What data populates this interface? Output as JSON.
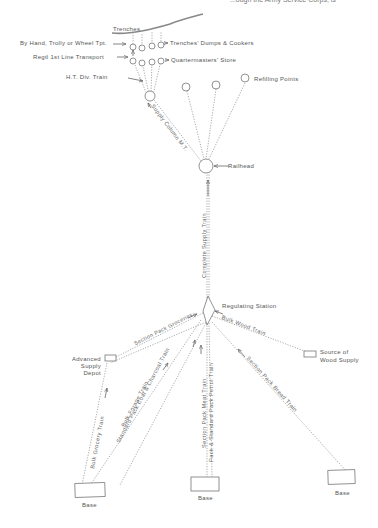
{
  "header_fragment": "...ough the Army Service Corps, is",
  "front": {
    "trenches": "Trenches",
    "by_hand": "By Hand, Trolly or Wheel Tpt.",
    "regtl_transport": "Regtl 1st Line Transport",
    "ht_div_train": "H.T. Div. Train",
    "trenches_dumps": "Trenches' Dumps & Cookers",
    "quartermasters_store": "Quartermasters' Store",
    "refilling_points": "Refilling Points"
  },
  "middle": {
    "supply_column": "Supply Column M.T.",
    "railhead": "Railhead",
    "complete_supply_train": "Complete Supply Train",
    "regulating_station": "Regulating Station"
  },
  "rear": {
    "advanced_supply_depot": "Advanced Supply Depot",
    "source_of_wood_supply_1": "Source of",
    "source_of_wood_supply_2": "Wood Supply",
    "base_left": "Base",
    "base_center": "Base",
    "base_right": "Base"
  },
  "flows": {
    "section_pack_groceries": "Section Pack Groceries",
    "bulk_wood_train": "Bulk Wood Train",
    "bulk_grocery_train": "Bulk Grocery Train",
    "bulk_forage_train": "Bulk Forage Train",
    "standard_pack_coal_charcoal": "Standard Pack Coal & Charcoal Train",
    "section_pack_meat_train": "Section Pack Meat Train",
    "pack_standard_pack_petrol": "Pack & Standard Pack Petrol Train",
    "section_pack_bread_train": "Section Pack Bread Train"
  },
  "colors": {
    "line": "#777777",
    "text": "#555555",
    "trench": "#888888"
  }
}
